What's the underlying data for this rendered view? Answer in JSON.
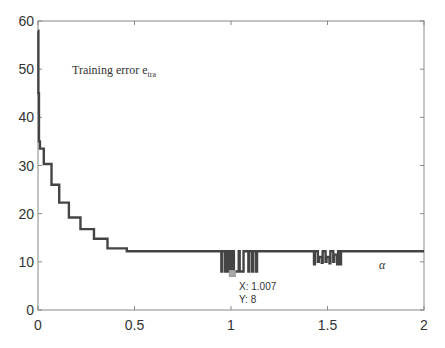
{
  "chart_data": {
    "type": "line",
    "title": "",
    "xlabel": "α",
    "ylabel": "",
    "xlim": [
      0,
      2
    ],
    "ylim": [
      0,
      60
    ],
    "grid": false,
    "x_ticks": [
      0,
      0.5,
      1,
      1.5,
      2
    ],
    "x_tick_labels": [
      "0",
      "0.5",
      "1",
      "1.5",
      "2"
    ],
    "y_ticks": [
      0,
      10,
      20,
      30,
      40,
      50,
      60
    ],
    "y_tick_labels": [
      "0",
      "10",
      "20",
      "30",
      "40",
      "50",
      "60"
    ],
    "annotations": [
      {
        "text": "Training error e",
        "subscript": "tra",
        "x": 0.1,
        "y": 49
      },
      {
        "text": "α",
        "x": 1.78,
        "y": 9
      }
    ],
    "datatip": {
      "x_label": "X: 1.007",
      "y_label": "Y: 8",
      "x": 1.007,
      "y": 8
    },
    "series": [
      {
        "name": "Training error e_tra",
        "color": "#444444",
        "step": true,
        "x": [
          0,
          0.002,
          0.005,
          0.01,
          0.03,
          0.07,
          0.11,
          0.16,
          0.22,
          0.29,
          0.36,
          0.46,
          0.95,
          0.955,
          0.97,
          0.975,
          0.985,
          0.99,
          1.0,
          1.005,
          1.015,
          1.02,
          1.04,
          1.045,
          1.06,
          1.065,
          1.09,
          1.095,
          1.11,
          1.115,
          1.13,
          1.135,
          1.43,
          1.435,
          1.45,
          1.455,
          1.47,
          1.475,
          1.49,
          1.495,
          1.51,
          1.515,
          1.53,
          1.535,
          1.55,
          1.555,
          1.565,
          1.57,
          2.0
        ],
        "y": [
          58,
          45,
          35,
          33.5,
          30.3,
          26,
          22.3,
          19.2,
          16.8,
          14.8,
          12.8,
          12.2,
          8,
          12.2,
          8,
          12.2,
          8,
          12.2,
          8,
          12.2,
          8,
          8,
          12.2,
          8,
          8,
          12.2,
          8,
          12.2,
          8,
          12.2,
          8,
          12.2,
          9.5,
          12.2,
          10,
          11,
          9.8,
          12.2,
          10,
          11,
          9.7,
          12.2,
          10,
          11.5,
          9.5,
          12.2,
          9.5,
          12.2,
          12.2
        ]
      }
    ]
  },
  "labels": {
    "annotation_main": "Training error e",
    "annotation_sub": "tra",
    "alpha": "α",
    "tip_x": "X: 1.007",
    "tip_y": "Y: 8"
  }
}
